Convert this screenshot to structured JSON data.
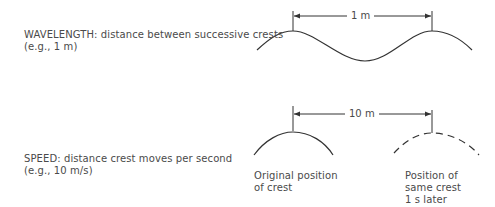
{
  "wavelength": {
    "title": "WAVELENGTH: distance between successive crests",
    "example": "(e.g., 1 m)",
    "dimension_label": "1 m"
  },
  "speed": {
    "title": "SPEED: distance crest moves per second",
    "example": "(e.g., 10 m/s)",
    "dimension_label": "10 m",
    "original_label": [
      "Original position",
      "of crest"
    ],
    "later_label": [
      "Position of",
      "same crest",
      "1 s later"
    ]
  },
  "colors": {
    "line": "#333333",
    "text": "#4a4a4a"
  }
}
